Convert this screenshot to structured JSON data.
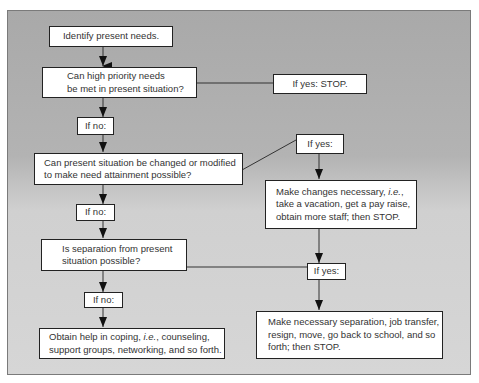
{
  "diagram": {
    "type": "flowchart",
    "nodes": {
      "identify": {
        "text": "Identify present needs."
      },
      "q1": {
        "text": "Can high priority needs\nbe met in present situation?"
      },
      "q1_yes": {
        "text": "If yes: STOP."
      },
      "q1_no": {
        "text": "If no:"
      },
      "q2": {
        "text": "Can present situation be changed or modified\nto make need attainment possible?"
      },
      "q2_yes": {
        "text": "If yes:"
      },
      "q2_no": {
        "text": "If no:"
      },
      "changes_pre": {
        "text": "Make changes necessary, "
      },
      "changes_ie": {
        "text": "i.e."
      },
      "changes_post": {
        "text": ",\ntake a vacation, get a pay raise,\nobtain more staff; then STOP."
      },
      "q3": {
        "text": "Is separation from present\nsituation possible?"
      },
      "q3_yes": {
        "text": "If yes:"
      },
      "q3_no": {
        "text": "If no:"
      },
      "coping_pre": {
        "text": "Obtain help in coping, "
      },
      "coping_ie": {
        "text": "i.e."
      },
      "coping_post": {
        "text": ", counseling,\nsupport groups, networking, and so forth."
      },
      "separation": {
        "text": "Make necessary separation, job transfer,\nresign, move, go back to school, and so\nforth; then STOP."
      }
    },
    "colors": {
      "background_top": "#a9a9a9",
      "background_bottom": "#d6d6d6",
      "box_fill": "#ffffff",
      "line": "#222222"
    }
  }
}
